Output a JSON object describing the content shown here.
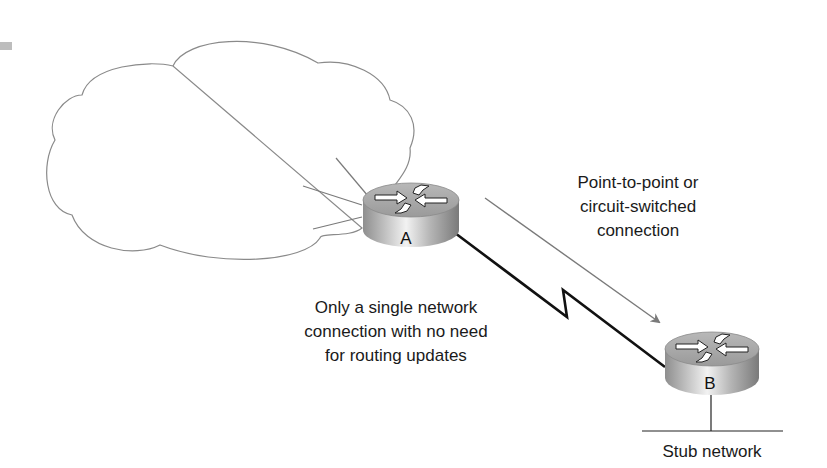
{
  "diagram": {
    "cloud": {
      "label": ""
    },
    "routers": [
      {
        "id": "A",
        "label": "A"
      },
      {
        "id": "B",
        "label": "B"
      }
    ],
    "annotations": {
      "link_type": [
        "Point-to-point or",
        "circuit-switched",
        "connection"
      ],
      "single_connection": [
        "Only a single network",
        "connection with no need",
        "for routing updates"
      ],
      "stub": "Stub network"
    },
    "colors": {
      "cloud_stroke": "#8a8a8a",
      "serial_link": "#111111",
      "arrow": "#7a7a7a",
      "router_top": "#a8a8a8",
      "router_body": "#bdbdbd",
      "marker": "#bdbdbd"
    }
  }
}
